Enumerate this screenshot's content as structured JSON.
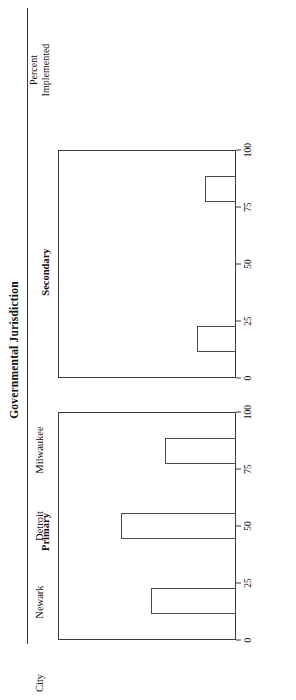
{
  "figure": {
    "title": "Governmental Jurisdiction",
    "category_axis_header": "City",
    "value_axis_title_line1": "Percent",
    "value_axis_title_line2": "Implemented",
    "line_color": "#3a3a3a",
    "bar_outline_color": "#4a4a4a",
    "bar_fill_color": "#ffffff"
  },
  "chart_data": {
    "type": "bar",
    "title": "Governmental Jurisdiction",
    "orientation": "horizontal-panels",
    "categories": [
      "Newark",
      "Detroit",
      "Milwaukee"
    ],
    "xlabel": "City",
    "ylabel": "Percent Implemented",
    "ylim": [
      0,
      100
    ],
    "yticks": [
      0,
      25,
      50,
      75,
      100
    ],
    "ytick_labels": [
      "0",
      "25",
      "50",
      "75",
      "100"
    ],
    "grid": false,
    "legend": "none",
    "panels": [
      {
        "name": "Primary",
        "label": "Primary",
        "values": [
          48,
          65,
          40
        ]
      },
      {
        "name": "Secondary",
        "label": "Secondary",
        "values": [
          22,
          0,
          17
        ]
      }
    ],
    "series": [
      {
        "name": "Primary",
        "values": [
          48,
          65,
          40
        ]
      },
      {
        "name": "Secondary",
        "values": [
          22,
          0,
          17
        ]
      }
    ]
  }
}
